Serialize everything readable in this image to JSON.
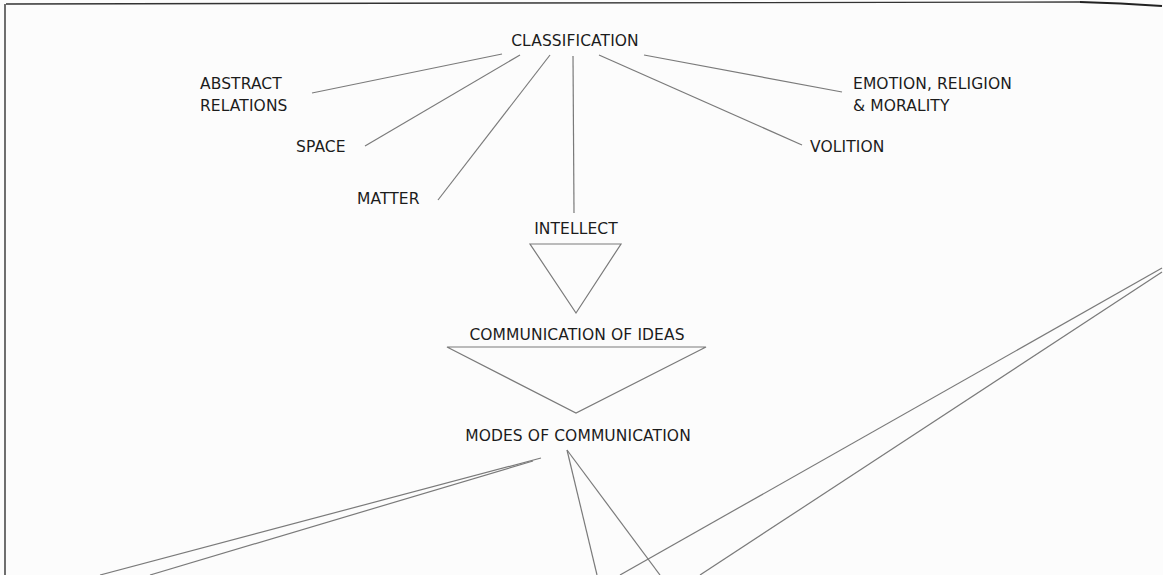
{
  "diagram": {
    "root": "CLASSIFICATION",
    "branches": {
      "abstract_relations": [
        "ABSTRACT",
        "RELATIONS"
      ],
      "space": "SPACE",
      "matter": "MATTER",
      "intellect": "INTELLECT",
      "volition": "VOLITION",
      "emotion": [
        "EMOTION, RELIGION",
        "& MORALITY"
      ]
    },
    "intellect_child": "COMMUNICATION OF IDEAS",
    "ideas_child": "MODES OF COMMUNICATION"
  },
  "colors": {
    "line": "#7a7a7a",
    "text": "#1c1c1c",
    "border": "#333333",
    "background": "#fcfcfc"
  }
}
